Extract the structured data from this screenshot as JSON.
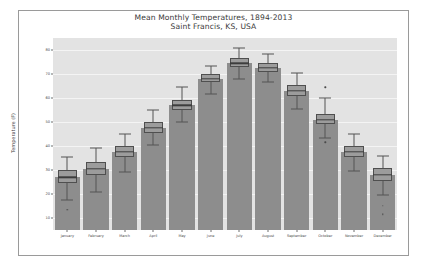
{
  "figure": {
    "title_line1": "Mean Monthly Temperatures, 1894-2013",
    "title_line2": "Saint Francis, KS, USA",
    "background_color": "#e3e3e3",
    "grid_color": "#f4f4f4",
    "bar_color": "#8d8d8d",
    "box_color": "#9c9c9c",
    "whisker_color": "#555555",
    "median_color": "#3d3d3d"
  },
  "chart_data": {
    "type": "bar",
    "title": "Mean Monthly Temperatures, 1894-2013\nSaint Francis, KS, USA",
    "xlabel": "",
    "ylabel": "Temperature (F)",
    "ylim": [
      5,
      85
    ],
    "yticks": [
      10,
      20,
      30,
      40,
      50,
      60,
      70,
      80
    ],
    "ytick_labels": [
      "10",
      "20",
      "30",
      "40",
      "50",
      "60",
      "70",
      "80"
    ],
    "grid": true,
    "legend": "none",
    "categories": [
      "January",
      "February",
      "March",
      "April",
      "May",
      "June",
      "July",
      "August",
      "September",
      "October",
      "November",
      "December"
    ],
    "values": [
      27.0,
      30.5,
      37.5,
      47.5,
      57.0,
      68.0,
      74.5,
      72.5,
      63.0,
      51.0,
      37.5,
      28.0
    ],
    "series": [
      {
        "name": "Monthly mean temperature distribution",
        "median": [
          27.0,
          30.5,
          37.5,
          47.5,
          57.0,
          68.0,
          74.5,
          72.5,
          63.0,
          51.0,
          37.5,
          28.0
        ],
        "q1": [
          24.5,
          28.0,
          35.5,
          45.5,
          55.0,
          66.5,
          73.0,
          71.0,
          61.0,
          49.0,
          35.5,
          25.5
        ],
        "q3": [
          30.0,
          33.5,
          40.0,
          50.0,
          59.0,
          70.0,
          76.5,
          74.5,
          65.5,
          53.5,
          40.0,
          31.0
        ],
        "whisker_low": [
          17.5,
          21.0,
          29.0,
          40.5,
          50.0,
          61.5,
          68.0,
          66.5,
          55.5,
          43.5,
          29.5,
          19.5
        ],
        "whisker_high": [
          35.5,
          39.0,
          45.0,
          55.0,
          64.5,
          73.5,
          81.0,
          78.5,
          70.5,
          60.0,
          45.0,
          36.0
        ],
        "outliers": [
          [
            13.5
          ],
          [],
          [],
          [],
          [],
          [],
          [],
          [],
          [],
          [
            64.5,
            41.5
          ],
          [],
          [
            15.0,
            11.5
          ]
        ]
      }
    ]
  }
}
